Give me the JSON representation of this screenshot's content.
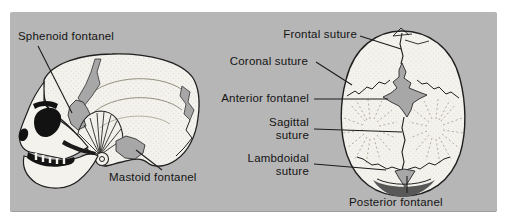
{
  "figure": {
    "labels": {
      "sphenoid": "Sphenoid fontanel",
      "mastoid": "Mastoid fontanel",
      "frontal": "Frontal suture",
      "coronal": "Coronal suture",
      "anterior": "Anterior fontanel",
      "sagittal": "Sagittal suture",
      "lambdoidal": "Lambdoidal suture",
      "posterior": "Posterior fontanel"
    },
    "colors": {
      "background": "#ffffff",
      "panel": "#b6b6b6",
      "bone": "#f4f2ed",
      "fontanel": "#a7a7a7",
      "outline": "#1f1f1f"
    }
  }
}
